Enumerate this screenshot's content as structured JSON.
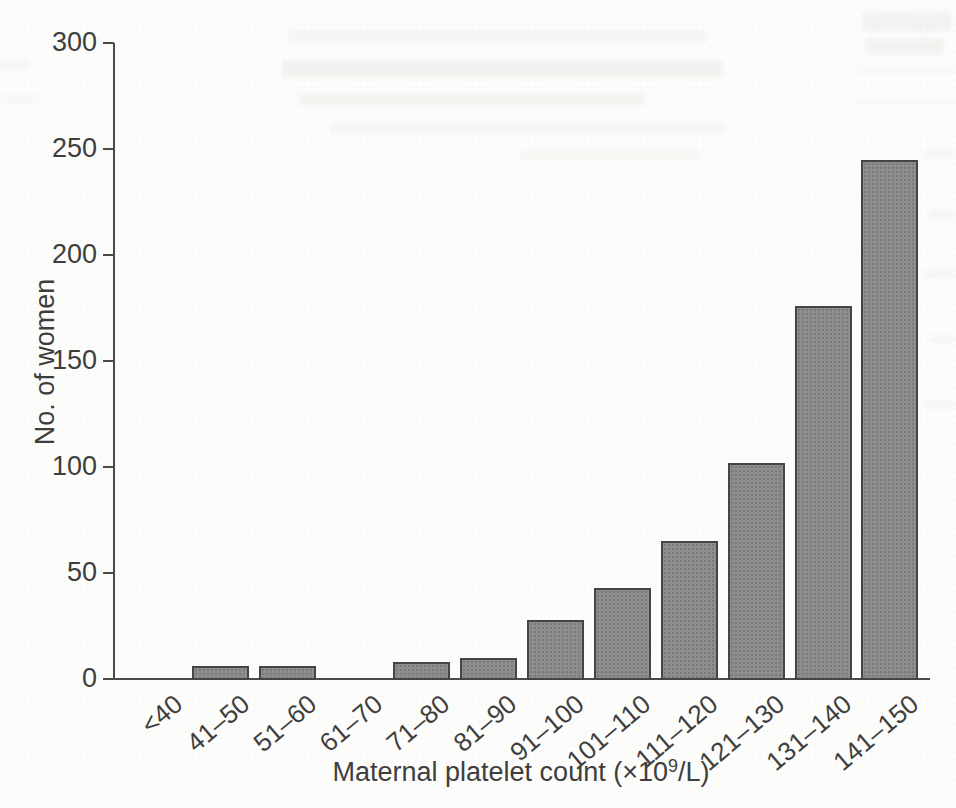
{
  "page": {
    "background_color": "#fcfcfa",
    "ink_color": "#3e3e3e",
    "axis_color": "#4b4b4b"
  },
  "chart_data": {
    "type": "bar",
    "title": "",
    "ylabel": "No. of women",
    "xlabel": "Maternal platelet count (×10⁹/L)",
    "xlabel_parts": {
      "prefix": "Maternal platelet count (×10",
      "superscript": "9",
      "suffix": "/L)"
    },
    "categories": [
      "<40",
      "41–50",
      "51–60",
      "61–70",
      "71–80",
      "81–90",
      "91–100",
      "101–110",
      "111–120",
      "121–130",
      "131–140",
      "141–150"
    ],
    "values": [
      0,
      6,
      6,
      0,
      8,
      10,
      28,
      43,
      65,
      102,
      176,
      245
    ],
    "yticks": [
      0,
      50,
      100,
      150,
      200,
      250,
      300
    ],
    "ylim": [
      0,
      300
    ],
    "grid": false,
    "legend": "none",
    "bar_fill_color": "#8e8e8e",
    "bar_border_color": "#454545"
  }
}
